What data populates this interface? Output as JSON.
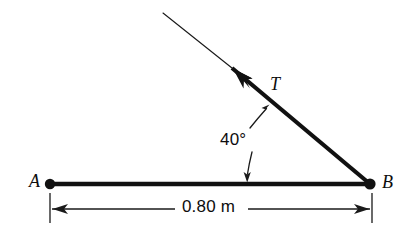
{
  "figure": {
    "type": "physics-free-body-diagram",
    "background_color": "#ffffff",
    "ink_color": "#0d0d0d"
  },
  "labels": {
    "point_a": "A",
    "point_b": "B",
    "tension": "T",
    "angle": "40°",
    "dimension": "0.80 m"
  },
  "geometry": {
    "point_a": {
      "x": 50,
      "y": 184
    },
    "point_b": {
      "x": 370,
      "y": 184
    },
    "beam_length_m": 0.8,
    "cable_angle_deg": 40,
    "cable_arrow_tip": {
      "x": 235,
      "y": 70
    },
    "cable_thin_tip": {
      "x": 163,
      "y": 13
    },
    "dimension_line_y": 209,
    "dimension_tick_left_x": 50,
    "dimension_tick_right_x": 372
  },
  "elements": {
    "beam_label": "beam segment A to B",
    "cable_label": "cable carrying tension T",
    "angle_leader_label": "angle leader lines from 40 degrees to cable and beam"
  }
}
